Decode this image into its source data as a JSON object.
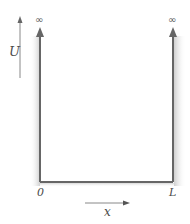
{
  "diagram": {
    "type": "infinite-square-well",
    "axes": {
      "vertical_label": "U",
      "horizontal_label": "x"
    },
    "walls": {
      "left_label": "0",
      "right_label": "L",
      "left_top": "∞",
      "right_top": "∞"
    },
    "colors": {
      "wall": "#666666",
      "shading": "#d0d0d0",
      "text": "#4a4a4a"
    }
  }
}
